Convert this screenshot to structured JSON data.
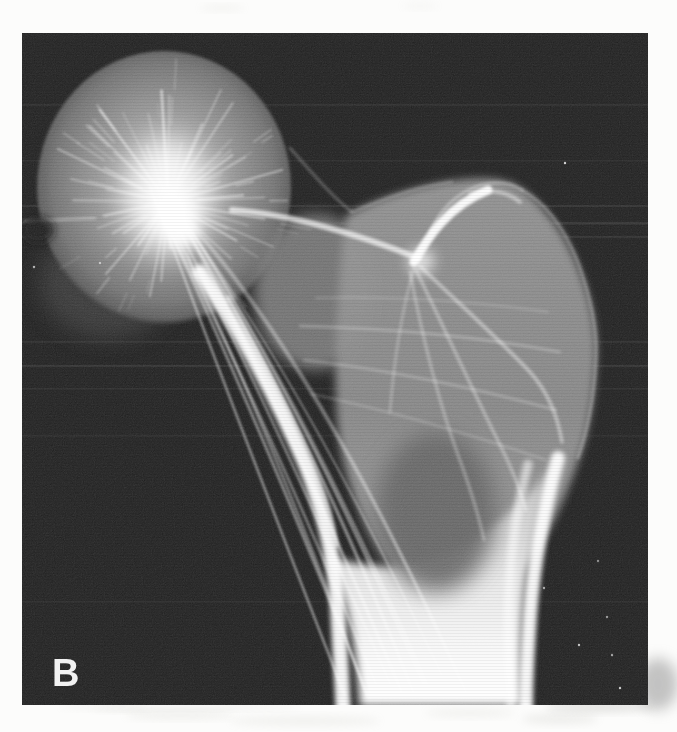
{
  "figure": {
    "panel_label": "B",
    "content_description": "Black-and-white radiograph of a proximal femur showing radiating trabecular bone patterns: femoral head at upper left with bright central starburst, greater trochanter at right, and femoral shaft descending to the bottom edge on a black film background",
    "colors": {
      "film_background": "#171717",
      "bone_highlight": "#ffffff",
      "page_background": "#fcfcfb",
      "label_color": "#f2f2f2"
    }
  }
}
